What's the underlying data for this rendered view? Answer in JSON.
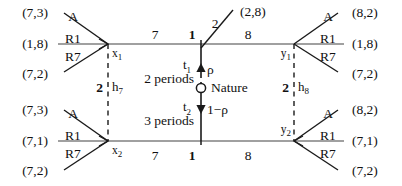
{
  "figure": {
    "type": "game-tree-diagram"
  },
  "payoffs": {
    "left": [
      "(7,3)",
      "(1,8)",
      "(7,2)",
      "(7,3)",
      "(7,1)",
      "(7,2)"
    ],
    "right": [
      "(8,2)",
      "(1,8)",
      "(7,2)",
      "(8,2)",
      "(7,1)",
      "(7,2)"
    ],
    "top_center": "(2,8)"
  },
  "actions": {
    "left_top_fan": {
      "upper": "A",
      "middle": "R1",
      "lower": "R7"
    },
    "left_bottom_fan": {
      "upper": "A",
      "middle": "R1",
      "lower": "R7"
    },
    "right_top_fan": {
      "upper": "A",
      "middle": "R1",
      "lower": "R7"
    },
    "right_bottom_fan": {
      "upper": "A",
      "middle": "R1",
      "lower": "R7"
    }
  },
  "edges": {
    "top_left": "7",
    "top_right": "8",
    "top_diagonal": "2",
    "bottom_left": "7",
    "bottom_right": "8"
  },
  "nodes": {
    "x1": {
      "name": "x",
      "sub": "1"
    },
    "x2": {
      "name": "x",
      "sub": "2"
    },
    "y1": {
      "name": "y",
      "sub": "1"
    },
    "y2": {
      "name": "y",
      "sub": "2"
    },
    "top_center_player": "1",
    "bottom_center_player": "1"
  },
  "information_sets": {
    "left": {
      "player": "2",
      "name": "h",
      "sub": "7"
    },
    "right": {
      "player": "2",
      "name": "h",
      "sub": "8"
    }
  },
  "nature": {
    "label": "Nature",
    "up_probability": "ρ",
    "down_probability": "1−ρ",
    "up_time": {
      "name": "t",
      "sub": "1"
    },
    "down_time": {
      "name": "t",
      "sub": "2"
    },
    "up_duration": "2 periods",
    "down_duration": "3 periods"
  },
  "colors": {
    "line": "#808080",
    "branch": "#1a1a1a",
    "text": "#111111",
    "background": "#ffffff"
  }
}
